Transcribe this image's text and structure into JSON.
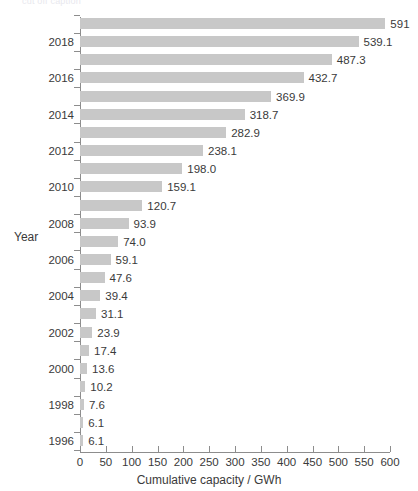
{
  "chart_data": {
    "type": "bar",
    "orientation": "horizontal",
    "title": "",
    "xlabel": "Cumulative capacity / GWh",
    "ylabel": "Year",
    "xlim": [
      0,
      600
    ],
    "xticks": [
      0,
      50,
      100,
      150,
      200,
      250,
      300,
      350,
      400,
      450,
      500,
      550,
      600
    ],
    "grid": false,
    "legend": null,
    "bar_color": "#c8c8c8",
    "categories": [
      "2019",
      "2018",
      "2017",
      "2016",
      "2015",
      "2014",
      "2013",
      "2012",
      "2011",
      "2010",
      "2009",
      "2008",
      "2007",
      "2006",
      "2005",
      "2004",
      "2003",
      "2002",
      "2001",
      "2000",
      "1999",
      "1998",
      "1997",
      "1996"
    ],
    "values": [
      591,
      539.1,
      487.3,
      432.7,
      369.9,
      318.7,
      282.9,
      238.1,
      198.0,
      159.1,
      120.7,
      93.9,
      74.0,
      59.1,
      47.6,
      39.4,
      31.1,
      23.9,
      17.4,
      13.6,
      10.2,
      7.6,
      6.1,
      0
    ],
    "value_labels": [
      "591",
      "539.1",
      "487.3",
      "432.7",
      "369.9",
      "318.7",
      "282.9",
      "238.1",
      "198.0",
      "159.1",
      "120.7",
      "93.9",
      "74.0",
      "59.1",
      "47.6",
      "39.4",
      "31.1",
      "23.9",
      "17.4",
      "13.6",
      "10.2",
      "7.6",
      "6.1"
    ],
    "bars": [
      {
        "year": "2019",
        "value": 591,
        "label": "591",
        "year_label": ""
      },
      {
        "year": "2018",
        "value": 539.1,
        "label": "539.1",
        "year_label": "2018"
      },
      {
        "year": "2017",
        "value": 487.3,
        "label": "487.3",
        "year_label": ""
      },
      {
        "year": "2016",
        "value": 432.7,
        "label": "432.7",
        "year_label": "2016"
      },
      {
        "year": "2015",
        "value": 369.9,
        "label": "369.9",
        "year_label": ""
      },
      {
        "year": "2014",
        "value": 318.7,
        "label": "318.7",
        "year_label": "2014"
      },
      {
        "year": "2013",
        "value": 282.9,
        "label": "282.9",
        "year_label": ""
      },
      {
        "year": "2012",
        "value": 238.1,
        "label": "238.1",
        "year_label": "2012"
      },
      {
        "year": "2011",
        "value": 198.0,
        "label": "198.0",
        "year_label": ""
      },
      {
        "year": "2010",
        "value": 159.1,
        "label": "159.1",
        "year_label": "2010"
      },
      {
        "year": "2009",
        "value": 120.7,
        "label": "120.7",
        "year_label": ""
      },
      {
        "year": "2008",
        "value": 93.9,
        "label": "93.9",
        "year_label": "2008"
      },
      {
        "year": "2007",
        "value": 74.0,
        "label": "74.0",
        "year_label": ""
      },
      {
        "year": "2006",
        "value": 59.1,
        "label": "59.1",
        "year_label": "2006"
      },
      {
        "year": "2005",
        "value": 47.6,
        "label": "47.6",
        "year_label": ""
      },
      {
        "year": "2004",
        "value": 39.4,
        "label": "39.4",
        "year_label": "2004"
      },
      {
        "year": "2003",
        "value": 31.1,
        "label": "31.1",
        "year_label": ""
      },
      {
        "year": "2002",
        "value": 23.9,
        "label": "23.9",
        "year_label": "2002"
      },
      {
        "year": "2001",
        "value": 17.4,
        "label": "17.4",
        "year_label": ""
      },
      {
        "year": "2000",
        "value": 13.6,
        "label": "13.6",
        "year_label": "2000"
      },
      {
        "year": "1999",
        "value": 10.2,
        "label": "10.2",
        "year_label": ""
      },
      {
        "year": "1998",
        "value": 7.6,
        "label": "7.6",
        "year_label": "1998"
      },
      {
        "year": "1997",
        "value": 6.1,
        "label": "6.1",
        "year_label": ""
      },
      {
        "year": "1996",
        "value": 6.1,
        "label": "6.1",
        "year_label": "1996"
      }
    ],
    "year_labels_shown": [
      "2018",
      "2016",
      "2014",
      "2012",
      "2010",
      "2008",
      "2006",
      "2004",
      "2002",
      "2000",
      "1998",
      "1996"
    ]
  },
  "axes": {
    "x_title": "Cumulative capacity / GWh",
    "y_title": "Year"
  },
  "top_remnant": "cut off caption"
}
